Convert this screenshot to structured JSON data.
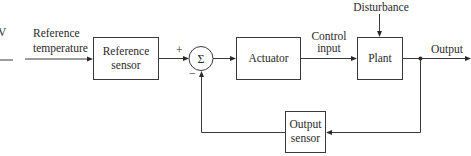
{
  "diagram": {
    "type": "closed-loop control block diagram",
    "edge_fragment": {
      "glyph": "V"
    },
    "input": {
      "label_line1": "Reference",
      "label_line2": "temperature"
    },
    "blocks": {
      "reference_sensor": {
        "line1": "Reference",
        "line2": "sensor"
      },
      "summing_junction": {
        "symbol": "Σ",
        "plus_sign": "+",
        "minus_sign": "−"
      },
      "actuator": {
        "label": "Actuator"
      },
      "plant": {
        "label": "Plant"
      },
      "output_sensor": {
        "line1": "Output",
        "line2": "sensor"
      }
    },
    "signals": {
      "control_input": {
        "line1": "Control",
        "line2": "input"
      },
      "disturbance": {
        "label": "Disturbance"
      },
      "output": {
        "label": "Output"
      }
    },
    "colors": {
      "stroke": "#3a3a3a",
      "text": "#2a2a2a",
      "background": "#ffffff"
    }
  }
}
